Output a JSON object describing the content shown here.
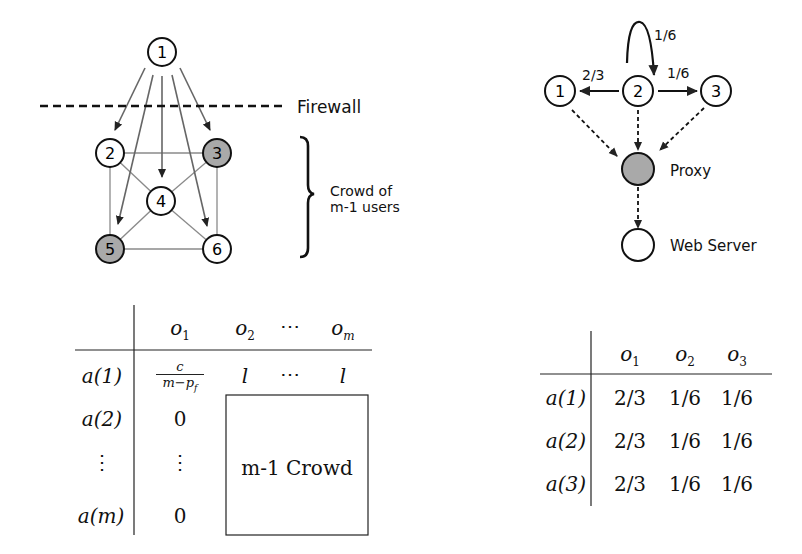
{
  "left_diagram": {
    "nodes": [
      {
        "id": "1",
        "label": "1",
        "shaded": false
      },
      {
        "id": "2",
        "label": "2",
        "shaded": false
      },
      {
        "id": "3",
        "label": "3",
        "shaded": true
      },
      {
        "id": "4",
        "label": "4",
        "shaded": false
      },
      {
        "id": "5",
        "label": "5",
        "shaded": true
      },
      {
        "id": "6",
        "label": "6",
        "shaded": false
      }
    ],
    "firewall_label": "Firewall",
    "crowd_label_line1": "Crowd of",
    "crowd_label_line2": "m-1 users",
    "colors": {
      "shaded_node": "#a9a9a9",
      "edge": "#888888",
      "arrow": "#555555"
    }
  },
  "right_diagram": {
    "nodes": [
      {
        "id": "1",
        "label": "1"
      },
      {
        "id": "2",
        "label": "2"
      },
      {
        "id": "3",
        "label": "3"
      }
    ],
    "self_loop_prob": "1/6",
    "to_1_prob": "2/3",
    "to_3_prob": "1/6",
    "proxy_label": "Proxy",
    "webserver_label": "Web Server"
  },
  "left_table": {
    "columns": [
      "o1",
      "o2",
      "⋯",
      "om"
    ],
    "rows": [
      {
        "label": "a(1)",
        "cells": [
          "c / (m−pf)",
          "l",
          "⋯",
          "l"
        ]
      },
      {
        "label": "a(2)",
        "cells": [
          "0"
        ]
      },
      {
        "label": "⋮",
        "cells": [
          "⋮"
        ]
      },
      {
        "label": "a(m)",
        "cells": [
          "0"
        ]
      }
    ],
    "box_label": "m-1 Crowd"
  },
  "right_table": {
    "columns": [
      "o1",
      "o2",
      "o3"
    ],
    "rows": [
      {
        "label": "a(1)",
        "cells": [
          "2/3",
          "1/6",
          "1/6"
        ]
      },
      {
        "label": "a(2)",
        "cells": [
          "2/3",
          "1/6",
          "1/6"
        ]
      },
      {
        "label": "a(3)",
        "cells": [
          "2/3",
          "1/6",
          "1/6"
        ]
      }
    ]
  }
}
